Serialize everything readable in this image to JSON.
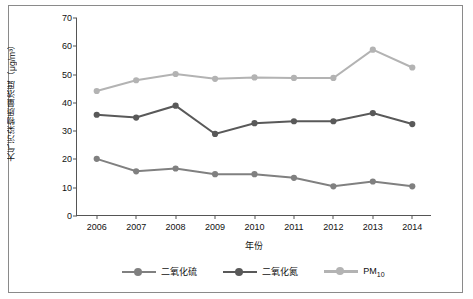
{
  "chart_data": {
    "type": "line",
    "title": "",
    "xlabel": "年份",
    "ylabel": "大气污染物质量浓度（μg/m³）",
    "categories": [
      "2006",
      "2007",
      "2008",
      "2009",
      "2010",
      "2011",
      "2012",
      "2013",
      "2014"
    ],
    "ylim": [
      0,
      70
    ],
    "yticks": [
      "0",
      "10",
      "20",
      "30",
      "40",
      "50",
      "60",
      "70"
    ],
    "grid": false,
    "legend_position": "bottom",
    "series": [
      {
        "name": "二氧化硫",
        "color": "#808080",
        "values": [
          20.2,
          15.8,
          16.8,
          14.8,
          14.8,
          13.5,
          10.5,
          12.2,
          10.5
        ]
      },
      {
        "name": "二氧化氮",
        "color": "#595959",
        "values": [
          35.8,
          34.8,
          39.0,
          29.0,
          32.8,
          33.5,
          33.5,
          36.4,
          32.5
        ]
      },
      {
        "name": "PM",
        "name_sub": "10",
        "color": "#b3b3b3",
        "values": [
          44.2,
          48.0,
          50.2,
          48.5,
          49.0,
          48.8,
          48.8,
          58.8,
          52.5
        ]
      }
    ]
  },
  "legend": [
    {
      "label": "二氧化硫",
      "color": "#808080"
    },
    {
      "label": "二氧化氮",
      "color": "#595959"
    },
    {
      "label": "PM",
      "sub": "10",
      "color": "#b3b3b3"
    }
  ]
}
